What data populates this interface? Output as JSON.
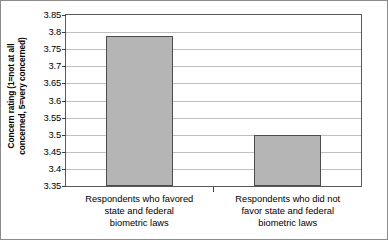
{
  "chart_data": {
    "type": "bar",
    "title": "",
    "subtitle": "",
    "xlabel": "",
    "ylabel": "Concern rating (1=not at all concerned, 5=very concerned)",
    "ylabel_lines": [
      "Concern rating (1=not at all",
      "concerned, 5=very concerned)"
    ],
    "categories": [
      "Respondents who favored state and federal biometric laws",
      "Respondents who did not favor state and federal biometric laws"
    ],
    "category_lines": [
      [
        "Respondents who favored",
        "state and federal",
        "biometric laws"
      ],
      [
        "Respondents who did not",
        "favor state and federal",
        "biometric laws"
      ]
    ],
    "values": [
      3.79,
      3.5
    ],
    "ylim": [
      3.35,
      3.85
    ],
    "ytick_step": 0.05,
    "ytick_labels": [
      "3.85",
      "3.8",
      "3.75",
      "3.7",
      "3.65",
      "3.6",
      "3.55",
      "3.5",
      "3.45",
      "3.4",
      "3.35"
    ],
    "ytick_values": [
      3.85,
      3.8,
      3.75,
      3.7,
      3.65,
      3.6,
      3.55,
      3.5,
      3.45,
      3.4,
      3.35
    ],
    "grid": true,
    "legend": false,
    "legend_position": "none",
    "colors": {
      "bar_fill": "#b5b5b5",
      "bar_border": "#4d4d4d",
      "gridline": "#bfbfbf",
      "plot_border": "#595959",
      "background": "#ffffff",
      "text": "#000000"
    }
  }
}
